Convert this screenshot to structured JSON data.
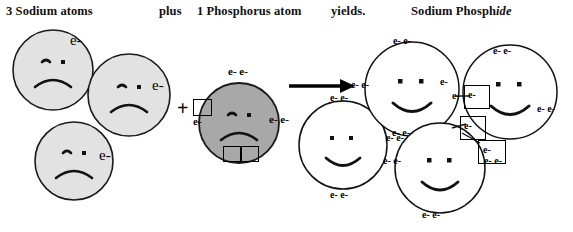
{
  "diagram": {
    "title_parts": {
      "reactant_sodium": "3 Sodium atoms",
      "plus_word": "plus",
      "reactant_phosphorus": "1 Phosphorus atom",
      "yields_word": "yields.",
      "product": "Sodium Phosph",
      "product_italic_suffix": "ide"
    },
    "plus_sign": "+",
    "electron_label": "e-",
    "electron_pair_label": "e- e-",
    "colors": {
      "sodium_fill": "#e2e2e2",
      "phosphorus_fill": "#a8a8a8",
      "product_fill": "#ffffff",
      "outline": "#1a1a1a",
      "text": "#111111"
    },
    "reactants": {
      "sodium_atoms": [
        {
          "id": "sodium-atom-1",
          "cx": 53,
          "cy": 70,
          "r": 40,
          "face": "sad",
          "electrons": [
            "e-"
          ]
        },
        {
          "id": "sodium-atom-2",
          "cx": 129,
          "cy": 95,
          "r": 41,
          "face": "sad",
          "electrons": [
            "e-"
          ]
        },
        {
          "id": "sodium-atom-3",
          "cx": 74,
          "cy": 161,
          "r": 39,
          "face": "sad",
          "electrons": [
            "e-"
          ]
        }
      ],
      "phosphorus_atom": {
        "id": "phosphorus-atom",
        "cx": 239,
        "cy": 123,
        "r": 40,
        "face": "sad",
        "electron_pairs": [
          "top",
          "left",
          "right"
        ],
        "empty_boxes": 3
      }
    },
    "arrow": {
      "label": "reaction-arrow",
      "x1": 289,
      "y1": 86,
      "x2": 350,
      "y2": 86
    },
    "products": {
      "ions": [
        {
          "id": "product-ion-1",
          "cx": 343,
          "cy": 145,
          "r": 44,
          "face": "happy",
          "kind": "sodium-ion"
        },
        {
          "id": "product-ion-2",
          "cx": 412,
          "cy": 89,
          "r": 47,
          "face": "happy",
          "kind": "sodium-ion"
        },
        {
          "id": "product-ion-3",
          "cx": 440,
          "cy": 168,
          "r": 45,
          "face": "happy",
          "kind": "sodium-ion"
        },
        {
          "id": "product-ion-4",
          "cx": 510,
          "cy": 92,
          "r": 47,
          "face": "happy",
          "kind": "phosphide-ion"
        }
      ],
      "boxed_electron_count": 3
    }
  }
}
